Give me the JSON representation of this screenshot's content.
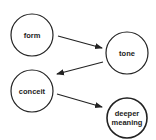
{
  "diagram": {
    "colors": {
      "stroke": "#222222",
      "background": "#ffffff",
      "text": "#222222"
    },
    "nodes": [
      {
        "id": "form",
        "label": "form",
        "lines": [
          "form"
        ],
        "cx": 32,
        "cy": 35,
        "r": 21
      },
      {
        "id": "tone",
        "label": "tone",
        "lines": [
          "tone"
        ],
        "cx": 127,
        "cy": 53,
        "r": 21
      },
      {
        "id": "conceit",
        "label": "conceit",
        "lines": [
          "conceit"
        ],
        "cx": 32,
        "cy": 91,
        "r": 21
      },
      {
        "id": "deeper-meaning",
        "label": "deeper meaning",
        "lines": [
          "deeper",
          "meaning"
        ],
        "cx": 127,
        "cy": 118,
        "r": 20
      }
    ],
    "edges": [
      {
        "from": "form",
        "to": "tone",
        "x1": 58,
        "y1": 36,
        "x2": 102,
        "y2": 48
      },
      {
        "from": "tone",
        "to": "conceit",
        "x1": 103,
        "y1": 62,
        "x2": 57,
        "y2": 74
      },
      {
        "from": "conceit",
        "to": "deeper-meaning",
        "x1": 57,
        "y1": 94,
        "x2": 102,
        "y2": 107
      }
    ]
  }
}
